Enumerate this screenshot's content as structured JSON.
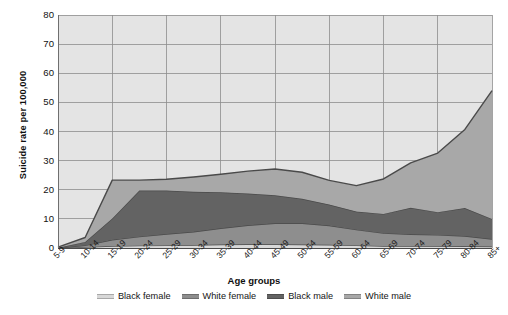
{
  "chart_data": {
    "type": "area",
    "stacked": true,
    "title": "",
    "xlabel": "Age groups",
    "ylabel": "Suicide rate per 100,000",
    "ylim": [
      0,
      80
    ],
    "ytick_step": 10,
    "yticks": [
      "0",
      "10",
      "20",
      "30",
      "40",
      "50",
      "60",
      "70",
      "80"
    ],
    "grid": true,
    "legend_position": "bottom",
    "categories": [
      "5-9",
      "10-14",
      "15-19",
      "20-24",
      "25-29",
      "30-34",
      "35-39",
      "40-44",
      "45-49",
      "50-54",
      "55-59",
      "60-64",
      "65-69",
      "70-74",
      "75-79",
      "80-84",
      "85+"
    ],
    "series": [
      {
        "name": "Black female",
        "color": "#d8d8d8",
        "values": [
          0.0,
          0.3,
          0.7,
          0.8,
          0.9,
          1.0,
          1.2,
          1.3,
          1.3,
          1.2,
          1.1,
          0.9,
          0.7,
          0.7,
          0.7,
          0.6,
          0.5
        ]
      },
      {
        "name": "White female",
        "color": "#8e8e8e",
        "values": [
          0.0,
          0.6,
          2.1,
          3.1,
          3.9,
          4.6,
          5.6,
          6.5,
          7.2,
          7.3,
          6.6,
          5.4,
          4.4,
          4.0,
          3.8,
          3.5,
          2.6
        ]
      },
      {
        "name": "Black male",
        "color": "#636363",
        "values": [
          0.1,
          1.2,
          7.3,
          15.8,
          14.9,
          13.7,
          12.3,
          10.9,
          9.6,
          8.4,
          7.2,
          6.2,
          6.6,
          9.1,
          7.8,
          9.6,
          6.9
        ]
      },
      {
        "name": "White male",
        "color": "#a8a8a8",
        "values": [
          0.2,
          1.5,
          13.2,
          3.6,
          3.9,
          5.1,
          6.2,
          7.7,
          9.0,
          9.1,
          8.3,
          8.9,
          12.0,
          15.4,
          20.3,
          27.0,
          44.0
        ]
      }
    ],
    "stack_totals": [
      0.3,
      3.6,
      23.3,
      23.3,
      23.6,
      24.4,
      25.3,
      26.4,
      27.1,
      26.0,
      23.2,
      21.4,
      23.7,
      29.2,
      32.6,
      40.7,
      54.0
    ]
  },
  "axes": {
    "y_label": "Suicide rate per 100,000",
    "x_label": "Age groups"
  },
  "legend": {
    "items": [
      {
        "label": "Black female",
        "color": "#d8d8d8"
      },
      {
        "label": "White female",
        "color": "#8e8e8e"
      },
      {
        "label": "Black male",
        "color": "#636363"
      },
      {
        "label": "White male",
        "color": "#a8a8a8"
      }
    ]
  },
  "style": {
    "plot_background": "#e4e4e4",
    "grid_color": "#8d8d8d",
    "text_color": "#141414"
  }
}
